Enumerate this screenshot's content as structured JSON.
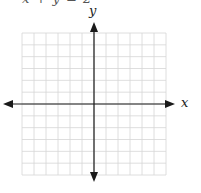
{
  "header": {
    "clipped_equation": "x + y = 2"
  },
  "chart_data": {
    "type": "line",
    "title": "",
    "xlabel": "x",
    "ylabel": "y",
    "grid": true,
    "grid_columns": 12,
    "grid_rows": 12,
    "xlim": [
      -6,
      6
    ],
    "ylim": [
      -6,
      6
    ],
    "series": [],
    "tick_labels": [],
    "legend": null,
    "colors": {
      "grid": "#d6d6d6",
      "axis": "#1a1a1a"
    }
  }
}
